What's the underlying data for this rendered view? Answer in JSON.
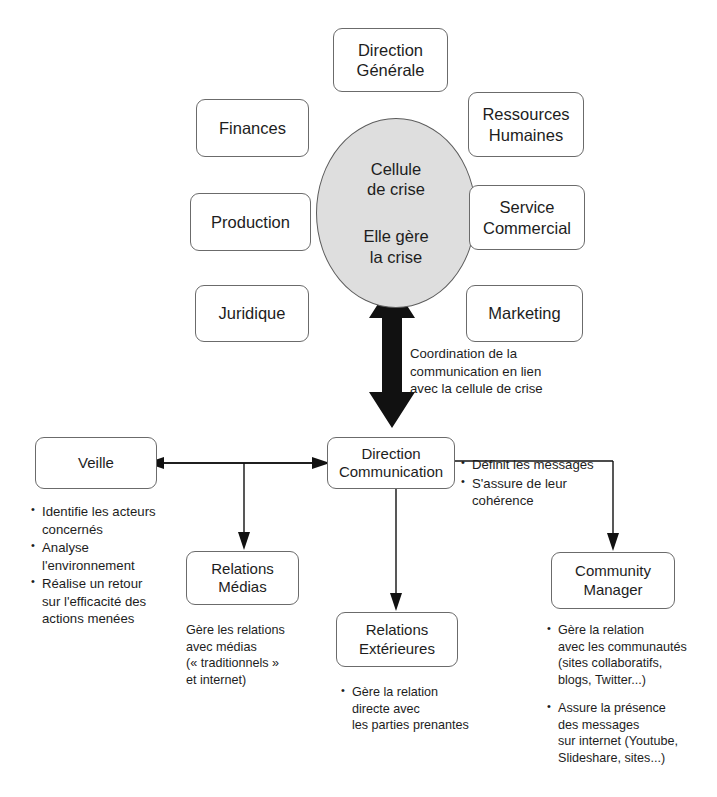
{
  "diagram": {
    "title_hidden": "",
    "colors": {
      "ellipse_fill": "#dedede",
      "box_border": "#6b6b6b",
      "text": "#1d1d1d",
      "arrow_dark": "#111111",
      "background": "#ffffff"
    },
    "center": {
      "line1": "Cellule\nde crise",
      "line2": "Elle gère\nla crise"
    },
    "crisis_cell_units": {
      "top": "Direction\nGénérale",
      "left": [
        "Finances",
        "Production",
        "Juridique"
      ],
      "right": [
        "Ressources\nHumaines",
        "Service\nCommercial",
        "Marketing"
      ]
    },
    "coordination_note": "Coordination de la\ncommunication en lien\navec la cellule de crise",
    "communication": {
      "hub": "Direction\nCommunication",
      "hub_bullets": [
        "Définit les messages",
        "S'assure de leur\ncohérence"
      ],
      "branches": [
        {
          "name": "Veille",
          "label": "Veille",
          "bullets": [
            "Identifie les acteurs\nconcernés",
            "Analyse\nl'environnement",
            "Réalise un retour\nsur l'efficacité des\nactions menées"
          ],
          "caption": ""
        },
        {
          "name": "Relations Médias",
          "label": "Relations\nMédias",
          "bullets": [],
          "caption": "Gère les relations\navec médias\n(« traditionnels »\net internet)"
        },
        {
          "name": "Relations Extérieures",
          "label": "Relations\nExtérieures",
          "bullets": [
            "Gère la relation\ndirecte avec\nles parties prenantes"
          ],
          "caption": ""
        },
        {
          "name": "Community Manager",
          "label": "Community\nManager",
          "bullets": [
            "Gère la relation\navec les communautés\n(sites collaboratifs,\nblogs, Twitter...)",
            "Assure la présence\ndes messages\nsur internet (Youtube,\nSlideshare, sites...)"
          ],
          "caption": ""
        }
      ]
    }
  }
}
